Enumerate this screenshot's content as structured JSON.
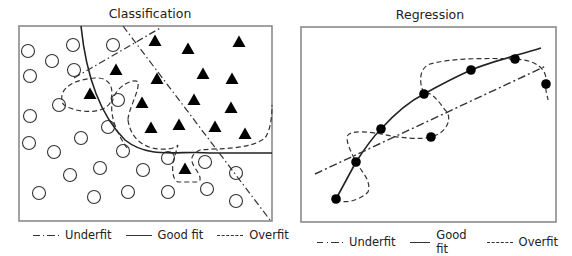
{
  "classification": {
    "title": "Classification",
    "frame": {
      "x": 19,
      "y": 26,
      "w": 253,
      "h": 195
    },
    "class_a_marker": "circle",
    "class_b_marker": "filled-triangle",
    "circles": [
      [
        28,
        51
      ],
      [
        52,
        61
      ],
      [
        73,
        45
      ],
      [
        113,
        45
      ],
      [
        30,
        76
      ],
      [
        74,
        70
      ],
      [
        59,
        105
      ],
      [
        30,
        116
      ],
      [
        118,
        100
      ],
      [
        29,
        143
      ],
      [
        54,
        152
      ],
      [
        81,
        138
      ],
      [
        108,
        127
      ],
      [
        123,
        151
      ],
      [
        70,
        175
      ],
      [
        100,
        168
      ],
      [
        143,
        170
      ],
      [
        168,
        158
      ],
      [
        39,
        193
      ],
      [
        94,
        197
      ],
      [
        128,
        192
      ],
      [
        168,
        192
      ],
      [
        205,
        162
      ],
      [
        207,
        189
      ],
      [
        236,
        173
      ],
      [
        236,
        201
      ]
    ],
    "triangles": [
      [
        155,
        41
      ],
      [
        188,
        49
      ],
      [
        239,
        42
      ],
      [
        116,
        70
      ],
      [
        157,
        79
      ],
      [
        203,
        74
      ],
      [
        232,
        79
      ],
      [
        90,
        94
      ],
      [
        142,
        103
      ],
      [
        194,
        100
      ],
      [
        231,
        108
      ],
      [
        151,
        128
      ],
      [
        179,
        125
      ],
      [
        215,
        127
      ],
      [
        245,
        134
      ],
      [
        185,
        169
      ]
    ],
    "legend": {
      "underfit": "Underfit",
      "good_fit": "Good fit",
      "overfit": "Overfit"
    }
  },
  "regression": {
    "title": "Regression",
    "frame": {
      "x": 301,
      "y": 27,
      "w": 255,
      "h": 195
    },
    "points": [
      [
        336,
        199
      ],
      [
        356,
        162
      ],
      [
        381,
        129
      ],
      [
        431,
        137
      ],
      [
        424,
        94
      ],
      [
        471,
        70
      ],
      [
        515,
        59
      ],
      [
        546,
        84
      ]
    ],
    "legend": {
      "underfit": "Underfit",
      "good_fit": "Good fit",
      "overfit": "Overfit"
    }
  },
  "colors": {
    "line": "#222222",
    "frame": "#888888",
    "marker_fill": "#000000"
  }
}
